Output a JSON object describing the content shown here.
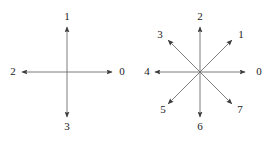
{
  "figure": {
    "background_color": "#ffffff",
    "line_color": "#6e6e6e",
    "arrow_color": "#3c3c3c",
    "label_color": "#1a1a1a",
    "panels": [
      {
        "name": "four-connectivity-diagram",
        "center": {
          "x": 67,
          "y": 72
        },
        "arrow_length": 45,
        "label_radius": 57,
        "directions": [
          {
            "label": "0",
            "angle_deg": 0,
            "dx": 1,
            "dy": 0,
            "label_x": 122,
            "label_y": 72
          },
          {
            "label": "1",
            "angle_deg": 90,
            "dx": 0,
            "dy": -1,
            "label_x": 67,
            "label_y": 17
          },
          {
            "label": "2",
            "angle_deg": 180,
            "dx": -1,
            "dy": 0,
            "label_x": 13,
            "label_y": 72
          },
          {
            "label": "3",
            "angle_deg": 270,
            "dx": 0,
            "dy": 1,
            "label_x": 67,
            "label_y": 127
          }
        ]
      },
      {
        "name": "eight-connectivity-diagram",
        "center": {
          "x": 200,
          "y": 72
        },
        "arrow_length": 45,
        "label_radius": 57,
        "directions": [
          {
            "label": "0",
            "angle_deg": 0,
            "dx": 1,
            "dy": 0,
            "label_x": 259,
            "label_y": 72
          },
          {
            "label": "1",
            "angle_deg": 45,
            "dx": 0.707,
            "dy": -0.707,
            "label_x": 241,
            "label_y": 35
          },
          {
            "label": "2",
            "angle_deg": 90,
            "dx": 0,
            "dy": -1,
            "label_x": 200,
            "label_y": 17
          },
          {
            "label": "3",
            "angle_deg": 135,
            "dx": -0.707,
            "dy": -0.707,
            "label_x": 160,
            "label_y": 35
          },
          {
            "label": "4",
            "angle_deg": 180,
            "dx": -1,
            "dy": 0,
            "label_x": 147,
            "label_y": 72
          },
          {
            "label": "5",
            "angle_deg": 225,
            "dx": -0.707,
            "dy": 0.707,
            "label_x": 163,
            "label_y": 110
          },
          {
            "label": "6",
            "angle_deg": 270,
            "dx": 0,
            "dy": 1,
            "label_x": 200,
            "label_y": 127
          },
          {
            "label": "7",
            "angle_deg": 315,
            "dx": 0.707,
            "dy": 0.707,
            "label_x": 240,
            "label_y": 110
          }
        ]
      }
    ]
  }
}
